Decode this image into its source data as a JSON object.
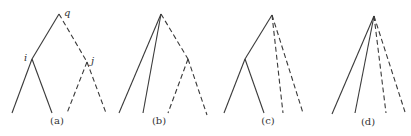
{
  "diagram": {
    "title": "",
    "line_color": "#3a3a3a",
    "panels": [
      {
        "id": "a",
        "caption": "(a)",
        "caption_pos": [
          57,
          124
        ],
        "nodes": [
          {
            "id": "q",
            "x": 59,
            "y": 14,
            "label": "q",
            "label_pos": [
              64,
              16
            ]
          },
          {
            "id": "i",
            "x": 32,
            "y": 59,
            "label": "i",
            "label_pos": [
              24,
              61
            ]
          },
          {
            "id": "j",
            "x": 87,
            "y": 62,
            "label": "j",
            "label_pos": [
              91,
              64
            ]
          }
        ],
        "edges": [
          {
            "from": [
              59,
              14
            ],
            "to": [
              32,
              59
            ],
            "style": "solid"
          },
          {
            "from": [
              59,
              14
            ],
            "to": [
              87,
              62
            ],
            "style": "dashed"
          },
          {
            "from": [
              32,
              59
            ],
            "to": [
              12,
              113
            ],
            "style": "solid"
          },
          {
            "from": [
              32,
              59
            ],
            "to": [
              52,
              113
            ],
            "style": "solid"
          },
          {
            "from": [
              87,
              62
            ],
            "to": [
              67,
              113
            ],
            "style": "dashed"
          },
          {
            "from": [
              87,
              62
            ],
            "to": [
              106,
              113
            ],
            "style": "dashed"
          }
        ]
      },
      {
        "id": "b",
        "caption": "(b)",
        "caption_pos": [
          159,
          124
        ],
        "nodes": [],
        "edges": [
          {
            "from": [
              161,
              14
            ],
            "to": [
              119,
              113
            ],
            "style": "solid"
          },
          {
            "from": [
              161,
              14
            ],
            "to": [
              143,
              113
            ],
            "style": "solid"
          },
          {
            "from": [
              161,
              14
            ],
            "to": [
              188,
              59
            ],
            "style": "dashed"
          },
          {
            "from": [
              188,
              59
            ],
            "to": [
              168,
              113
            ],
            "style": "dashed"
          },
          {
            "from": [
              188,
              59
            ],
            "to": [
              207,
              115
            ],
            "style": "dashed"
          }
        ]
      },
      {
        "id": "c",
        "caption": "(c)",
        "caption_pos": [
          268,
          124
        ],
        "nodes": [],
        "edges": [
          {
            "from": [
              272,
              15
            ],
            "to": [
              245,
              59
            ],
            "style": "solid"
          },
          {
            "from": [
              245,
              59
            ],
            "to": [
              224,
              113
            ],
            "style": "solid"
          },
          {
            "from": [
              245,
              59
            ],
            "to": [
              264,
              113
            ],
            "style": "solid"
          },
          {
            "from": [
              272,
              15
            ],
            "to": [
              283,
              113
            ],
            "style": "dashed"
          },
          {
            "from": [
              272,
              15
            ],
            "to": [
              303,
              113
            ],
            "style": "dashed"
          }
        ]
      },
      {
        "id": "d",
        "caption": "(d)",
        "caption_pos": [
          368,
          125
        ],
        "nodes": [],
        "edges": [
          {
            "from": [
              374,
              16
            ],
            "to": [
              332,
              114
            ],
            "style": "solid"
          },
          {
            "from": [
              374,
              16
            ],
            "to": [
              355,
              113
            ],
            "style": "solid"
          },
          {
            "from": [
              374,
              16
            ],
            "to": [
              386,
              113
            ],
            "style": "dashed"
          },
          {
            "from": [
              374,
              16
            ],
            "to": [
              405,
              112
            ],
            "style": "dashed"
          }
        ]
      }
    ]
  }
}
